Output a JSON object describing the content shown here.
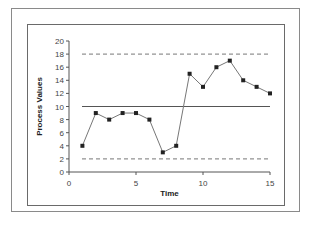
{
  "chart_data": {
    "type": "line",
    "title": "",
    "xlabel": "Time",
    "ylabel": "Process Values",
    "xlim": [
      0,
      15
    ],
    "ylim": [
      0,
      20
    ],
    "x_ticks": [
      0,
      5,
      10,
      15
    ],
    "y_ticks": [
      0,
      2,
      4,
      6,
      8,
      10,
      12,
      14,
      16,
      18,
      20
    ],
    "grid": false,
    "legend": null,
    "x": [
      1,
      2,
      3,
      4,
      5,
      6,
      7,
      8,
      9,
      10,
      11,
      12,
      13,
      14,
      15
    ],
    "series": [
      {
        "name": "Process Values",
        "values": [
          4,
          9,
          8,
          9,
          9,
          8,
          3,
          4,
          15,
          13,
          16,
          17,
          14,
          13,
          12
        ],
        "color": "#777777",
        "marker": "square",
        "marker_color": "#222222"
      }
    ],
    "reference_lines": [
      {
        "name": "Upper Control Limit",
        "y": 18,
        "style": "dashed",
        "color": "#777777"
      },
      {
        "name": "Center Line",
        "y": 10,
        "style": "solid",
        "color": "#555555"
      },
      {
        "name": "Lower Control Limit",
        "y": 2,
        "style": "dashed",
        "color": "#777777"
      }
    ]
  }
}
